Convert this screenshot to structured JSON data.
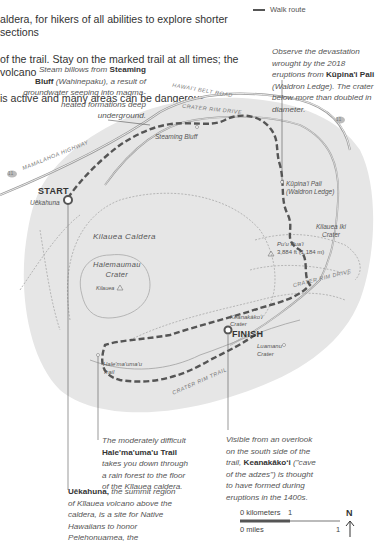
{
  "intro": {
    "lines": [
      "aldera, for hikers of all abilities to explore shorter sections",
      "of the trail. Stay on the marked trail at all times; the volcano",
      "is active and many areas can be dangerous."
    ]
  },
  "legend": {
    "walk_route_label": "Walk route",
    "walk_route_icon": "dashed-line-icon"
  },
  "callouts": {
    "steaming_bluff": {
      "pre": "Steam billows from ",
      "bold": "Steaming Bluff",
      "post": " (Wahinepaku), a result of groundwater seeping into magma-heated formations deep underground."
    },
    "kupinai_pali": {
      "pre": "Observe the devastation wrought by the 2018 eruptions from ",
      "bold": "Kūpina'i Pali",
      "post": " (Waldron Ledge). The crater below more than doubled in diameter."
    },
    "halemaumau_trail": {
      "pre": "The moderately difficult ",
      "bold": "Hale'ma'uma'u Trail",
      "post": " takes you down through a rain forest to the floor of the Kīlauea caldera."
    },
    "keanakakoi": {
      "pre": "Visible from an overlook on the south side of the trail, ",
      "bold": "Keanakākoʻi",
      "post": " (\"cave of the adzes\") is thought to have formed during eruptions in the 1400s."
    },
    "uekahuna": {
      "bold": "Uēkahuna,",
      "post": " the summit region of Kīlauea volcano above the caldera, is a site for Native Hawaiians to honor Pelehonuamea, the"
    }
  },
  "map": {
    "roads": {
      "hawaii_belt_road": "HAWAI'I BELT ROAD",
      "crater_rim_drive_top": "CRATER RIM DRIVE",
      "crater_rim_drive_right": "CRATER RIM DRIVE",
      "mamalahoa_highway": "MAMALAHOA   HIGHWAY",
      "crater_rim_trail": "CRATER RIM TRAIL",
      "route_shield_left": "11",
      "route_shield_right": "11"
    },
    "places": {
      "start": "START",
      "uekahuna": "Uēkahuna",
      "steaming_bluff": "Steaming Bluff",
      "kupinai_pali_1": "Kūpina'i Pali",
      "kupinai_pali_2": "(Waldron Ledge)",
      "kilauea_caldera": "Kilauea Caldera",
      "halemaumau_1": "Halemaumau",
      "halemaumau_2": "Crater",
      "kilauea_peak": "Kilauea",
      "kilauea_iki_1": "Kilauea Iki",
      "kilauea_iki_2": "Crater",
      "puu_puai_1": "Pu'u Pua'i",
      "puu_puai_2": "3,884 ft (1,184 m)",
      "keanakakoi_1": "Keanakākoʻi",
      "keanakakoi_2": "Crater",
      "finish": "FINISH",
      "luamanu_1": "Luamanu",
      "luamanu_2": "Crater",
      "halemaumau_trail_1": "Hale'ma'uma'u",
      "halemaumau_trail_2": "Trail"
    },
    "colors": {
      "terrain": "#e6e6e6",
      "route": "#555555",
      "road": "#9a9a9a",
      "trail": "#a8a8a8"
    }
  },
  "scale": {
    "km_label": "0 kilometers",
    "km_value": "1",
    "mi_label": "0 miles",
    "mi_value": "1"
  },
  "north": {
    "label": "N",
    "icon": "north-arrow-icon"
  }
}
